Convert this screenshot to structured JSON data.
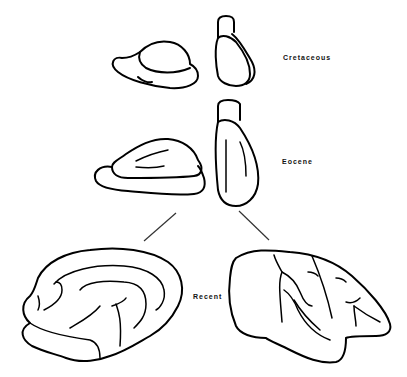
{
  "figure": {
    "stages": [
      {
        "epoch": "Cretaceous",
        "views": [
          "lateral-view",
          "dorsal-view"
        ]
      },
      {
        "epoch": "Eocene",
        "views": [
          "lateral-view",
          "dorsal-view"
        ]
      },
      {
        "epoch": "Recent",
        "views": [
          "medial-view",
          "lateral-view"
        ]
      }
    ],
    "labels": {
      "cretaceous": "Cretaceous",
      "eocene": "Eocene",
      "recent": "Recent"
    },
    "colors": {
      "line": "#000000",
      "background": "#ffffff"
    }
  }
}
